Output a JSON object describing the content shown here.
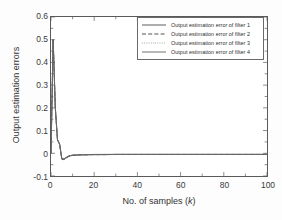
{
  "chart_data": {
    "type": "line",
    "title": "",
    "xlabel": "No. of samples (k)",
    "ylabel": "Output estimation errors",
    "xlim": [
      0,
      100
    ],
    "ylim": [
      -0.1,
      0.6
    ],
    "grid": false,
    "legend_position": "top-right",
    "xticks": [
      0,
      20,
      40,
      60,
      80,
      100
    ],
    "xtick_labels": [
      "0",
      "20",
      "40",
      "60",
      "80",
      "100"
    ],
    "xminor_step": 10,
    "yticks": [
      -0.1,
      0,
      0.1,
      0.2,
      0.3,
      0.4,
      0.5,
      0.6
    ],
    "ytick_labels": [
      "-0.1",
      "0",
      "0.1",
      "0.2",
      "0.3",
      "0.4",
      "0.5",
      "0.6"
    ],
    "series": [
      {
        "name": "Output estimation error of filter 1",
        "style": "solid",
        "color": "#4a4a4a",
        "x": [
          0,
          1,
          2,
          3,
          4,
          5,
          6,
          7,
          8,
          9,
          10,
          12,
          14,
          16,
          18,
          20,
          25,
          30,
          35,
          40,
          50,
          60,
          70,
          80,
          90,
          100
        ],
        "values": [
          0.0,
          0.5,
          0.2,
          0.06,
          0.04,
          -0.025,
          -0.027,
          -0.02,
          -0.014,
          -0.011,
          -0.009,
          -0.008,
          -0.007,
          -0.007,
          -0.006,
          -0.006,
          -0.006,
          -0.005,
          -0.005,
          -0.005,
          -0.005,
          -0.005,
          -0.005,
          -0.005,
          -0.005,
          -0.005
        ]
      },
      {
        "name": "Output estimation error of filter 2",
        "style": "dashed",
        "color": "#3d3d3d",
        "x": [
          0,
          1,
          2,
          3,
          4,
          5,
          6,
          7,
          8,
          9,
          10,
          12,
          14,
          16,
          18,
          20,
          25,
          30,
          35,
          40,
          50,
          60,
          70,
          80,
          90,
          100
        ],
        "values": [
          0.0,
          0.5,
          0.2,
          0.06,
          0.04,
          -0.026,
          -0.028,
          -0.021,
          -0.015,
          -0.012,
          -0.009,
          -0.008,
          -0.007,
          -0.007,
          -0.006,
          -0.006,
          -0.006,
          -0.005,
          -0.005,
          -0.005,
          -0.005,
          -0.005,
          -0.005,
          -0.005,
          -0.005,
          -0.005
        ]
      },
      {
        "name": "Output estimation error of filter 3",
        "style": "dotted",
        "color": "#8a8a8a",
        "x": [
          0,
          1,
          2,
          3,
          4,
          5,
          6,
          7,
          8,
          9,
          10,
          12,
          14,
          16,
          18,
          20,
          25,
          30,
          35,
          40,
          50,
          60,
          70,
          80,
          90,
          100
        ],
        "values": [
          0.0,
          0.5,
          0.2,
          0.06,
          0.04,
          -0.024,
          -0.026,
          -0.019,
          -0.013,
          -0.01,
          -0.008,
          -0.007,
          -0.007,
          -0.006,
          -0.006,
          -0.006,
          -0.005,
          -0.005,
          -0.005,
          -0.005,
          -0.005,
          -0.005,
          -0.005,
          -0.005,
          -0.005,
          -0.005
        ]
      },
      {
        "name": "Output estimation error of filter 4",
        "style": "solid",
        "color": "#636363",
        "x": [
          0,
          1,
          2,
          3,
          4,
          5,
          6,
          7,
          8,
          9,
          10,
          12,
          14,
          16,
          18,
          20,
          25,
          30,
          35,
          40,
          50,
          60,
          70,
          80,
          90,
          100
        ],
        "values": [
          0.0,
          0.5,
          0.2,
          0.06,
          0.04,
          -0.022,
          -0.024,
          -0.018,
          -0.012,
          -0.01,
          -0.008,
          -0.007,
          -0.006,
          -0.006,
          -0.006,
          -0.005,
          -0.005,
          -0.005,
          -0.005,
          -0.005,
          -0.005,
          -0.005,
          -0.005,
          -0.005,
          -0.005,
          -0.005
        ]
      }
    ]
  },
  "axes": {
    "xlabel_prefix": "No. of samples (",
    "xlabel_var": "k",
    "xlabel_suffix": ")",
    "ylabel": "Output estimation errors"
  },
  "legend": {
    "entries": [
      {
        "label": "Output estimation error of filter 1"
      },
      {
        "label": "Output estimation error of filter 2"
      },
      {
        "label": "Output estimation error of filter 3"
      },
      {
        "label": "Output estimation error of filter 4"
      }
    ]
  },
  "colors": {
    "frame": "#5a5a5a",
    "background": "#ffffff",
    "text": "#333333"
  }
}
